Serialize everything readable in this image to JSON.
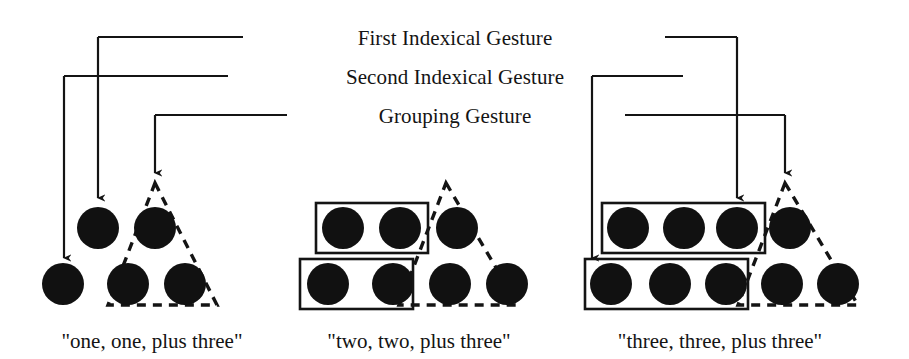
{
  "figure": {
    "title_present": false,
    "background_color": "#ffffff",
    "ink_color": "#141414",
    "dot_color": "#111111"
  },
  "connectors": [
    {
      "id": "first-indexical-gesture",
      "label": "First Indexical Gesture",
      "label_x": 455,
      "label_y": 45,
      "rail_y": 37,
      "left_rail_x1": 243,
      "left_rail_x2": 98,
      "right_rail_x1": 665,
      "right_rail_x2": 737,
      "targets": [
        {
          "x": 98,
          "y_from": 37,
          "y_to": 198
        },
        {
          "x": 737,
          "y_from": 37,
          "y_to": 198
        }
      ]
    },
    {
      "id": "second-indexical-gesture",
      "label": "Second Indexical Gesture",
      "label_x": 455,
      "label_y": 84,
      "rail_y": 76,
      "left_rail_x1": 228,
      "left_rail_x2": 64,
      "right_rail_x1": 683,
      "right_rail_x2": 592,
      "targets": [
        {
          "x": 64,
          "y_from": 76,
          "y_to": 258
        },
        {
          "x": 592,
          "y_from": 76,
          "y_to": 258
        }
      ]
    },
    {
      "id": "grouping-gesture",
      "label": "Grouping Gesture",
      "label_x": 455,
      "label_y": 123,
      "rail_y": 115,
      "left_rail_x1": 287,
      "left_rail_x2": 155,
      "right_rail_x1": 625,
      "right_rail_x2": 785,
      "targets": [
        {
          "x": 155,
          "y_from": 115,
          "y_to": 173
        },
        {
          "x": 785,
          "y_from": 115,
          "y_to": 173
        }
      ]
    }
  ],
  "panels": [
    {
      "id": "panel-one",
      "caption": "\"one, one, plus three\"",
      "caption_x": 152,
      "caption_y": 348,
      "dot_radius": 21,
      "rows": [
        {
          "name": "top-row",
          "y": 228,
          "dots_x": [
            98,
            155
          ]
        },
        {
          "name": "bottom-row",
          "y": 284,
          "dots_x": [
            63,
            128,
            185
          ]
        }
      ],
      "triangle": {
        "apex_x": 155,
        "apex_y": 183,
        "left_x": 108,
        "right_x": 217,
        "base_y": 305
      },
      "rectangles": []
    },
    {
      "id": "panel-two",
      "caption": "\"two, two, plus three\"",
      "caption_x": 419,
      "caption_y": 348,
      "dot_radius": 21,
      "rows": [
        {
          "name": "top-row",
          "y": 228,
          "dots_x": [
            343,
            400,
            457
          ]
        },
        {
          "name": "bottom-row",
          "y": 284,
          "dots_x": [
            328,
            393,
            450,
            507
          ]
        }
      ],
      "triangle": {
        "apex_x": 446,
        "apex_y": 183,
        "left_x": 399,
        "right_x": 518,
        "base_y": 305
      },
      "rectangles": [
        {
          "name": "top-group-rect",
          "x": 316,
          "y": 203,
          "w": 112,
          "h": 50
        },
        {
          "name": "bottom-group-rect",
          "x": 300,
          "y": 259,
          "w": 113,
          "h": 50
        }
      ]
    },
    {
      "id": "panel-three",
      "caption": "\"three, three, plus three\"",
      "caption_x": 720,
      "caption_y": 348,
      "dot_radius": 21,
      "rows": [
        {
          "name": "top-row",
          "y": 228,
          "dots_x": [
            628,
            684,
            737,
            790
          ]
        },
        {
          "name": "bottom-row",
          "y": 284,
          "dots_x": [
            611,
            670,
            726,
            782,
            838
          ]
        }
      ],
      "triangle": {
        "apex_x": 785,
        "apex_y": 183,
        "left_x": 738,
        "right_x": 858,
        "base_y": 305
      },
      "rectangles": [
        {
          "name": "top-group-rect",
          "x": 602,
          "y": 203,
          "w": 163,
          "h": 50
        },
        {
          "name": "bottom-group-rect",
          "x": 585,
          "y": 259,
          "w": 163,
          "h": 50
        }
      ]
    }
  ]
}
